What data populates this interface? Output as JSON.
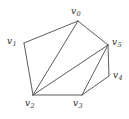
{
  "figure": {
    "title": "",
    "type": "planar-graph-diagram",
    "width": 129,
    "height": 119,
    "background_color": "#ffffff",
    "edge_color": "#4a4a4a",
    "label_color": "#2b2b2b"
  },
  "graph": {
    "vertices": [
      {
        "id": "v0",
        "name": "v",
        "subscript": "0",
        "x": 78,
        "y": 21,
        "label_x": 71,
        "label_y": 7
      },
      {
        "id": "v1",
        "name": "v",
        "subscript": "1",
        "x": 24,
        "y": 43,
        "label_x": 7,
        "label_y": 37
      },
      {
        "id": "v2",
        "name": "v",
        "subscript": "2",
        "x": 33,
        "y": 95,
        "label_x": 25,
        "label_y": 99
      },
      {
        "id": "v3",
        "name": "v",
        "subscript": "3",
        "x": 82,
        "y": 95,
        "label_x": 73,
        "label_y": 99
      },
      {
        "id": "v4",
        "name": "v",
        "subscript": "4",
        "x": 109,
        "y": 76,
        "label_x": 113,
        "label_y": 71
      },
      {
        "id": "v5",
        "name": "v",
        "subscript": "5",
        "x": 108,
        "y": 45,
        "label_x": 112,
        "label_y": 38
      }
    ],
    "edges": [
      {
        "from": "v0",
        "to": "v1"
      },
      {
        "from": "v0",
        "to": "v2"
      },
      {
        "from": "v0",
        "to": "v5"
      },
      {
        "from": "v1",
        "to": "v2"
      },
      {
        "from": "v2",
        "to": "v3"
      },
      {
        "from": "v2",
        "to": "v5"
      },
      {
        "from": "v3",
        "to": "v4"
      },
      {
        "from": "v3",
        "to": "v5"
      },
      {
        "from": "v4",
        "to": "v5"
      }
    ]
  }
}
